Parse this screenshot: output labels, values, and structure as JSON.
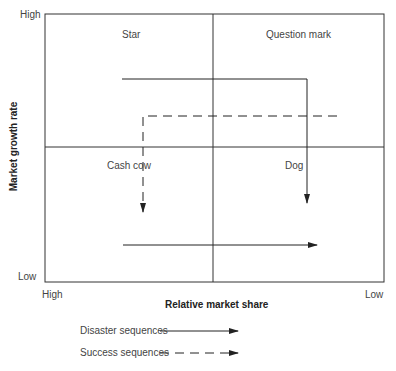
{
  "diagram": {
    "type": "BCG growth-share matrix",
    "y_axis": {
      "title": "Market growth rate",
      "high": "High",
      "low": "Low"
    },
    "x_axis": {
      "title": "Relative market share",
      "high": "High",
      "low": "Low"
    },
    "quadrants": {
      "top_left": "Star",
      "top_right": "Question mark",
      "bottom_left": "Cash cow",
      "bottom_right": "Dog"
    },
    "legend": {
      "disaster": "Disaster sequences",
      "success": "Success sequences"
    },
    "colors": {
      "line": "#222222",
      "text": "#444444"
    }
  }
}
